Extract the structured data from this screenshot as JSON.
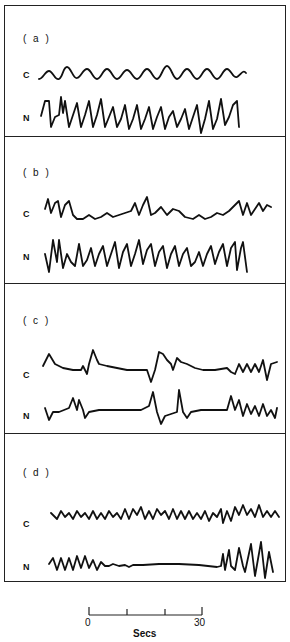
{
  "figure": {
    "panels": [
      {
        "id": "a",
        "label": "( a )",
        "traces": [
          {
            "name": "C"
          },
          {
            "name": "N"
          }
        ]
      },
      {
        "id": "b",
        "label": "( b )",
        "traces": [
          {
            "name": "C"
          },
          {
            "name": "N"
          }
        ]
      },
      {
        "id": "c",
        "label": "( c )",
        "traces": [
          {
            "name": "C"
          },
          {
            "name": "N"
          }
        ]
      },
      {
        "id": "d",
        "label": "( d )",
        "traces": [
          {
            "name": "C"
          },
          {
            "name": "N"
          }
        ]
      }
    ],
    "scale_bar": {
      "start_label": "0",
      "end_label": "30",
      "unit_label": "Secs",
      "ticks": 4
    },
    "line_color": "#111111",
    "background_color": "#ffffff"
  }
}
